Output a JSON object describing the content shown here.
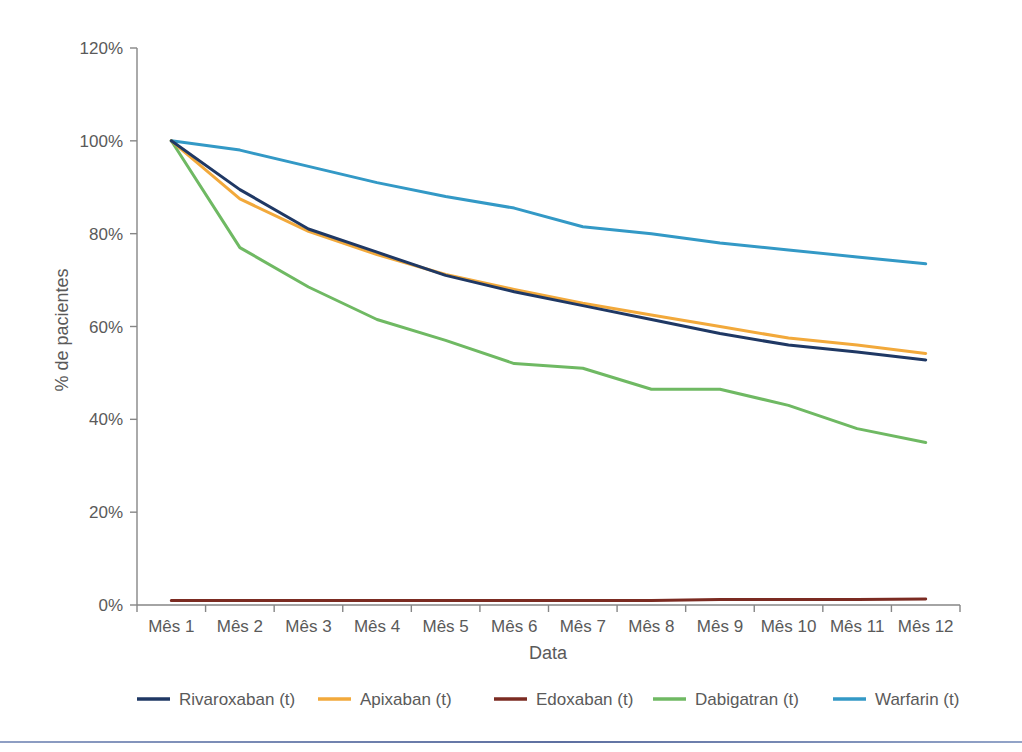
{
  "chart_data": {
    "type": "line",
    "title": "",
    "subtitle": "",
    "xlabel": "Data",
    "ylabel": "% de pacientes",
    "categories": [
      "Mês 1",
      "Mês 2",
      "Mês 3",
      "Mês 4",
      "Mês 5",
      "Mês 6",
      "Mês 7",
      "Mês 8",
      "Mês 9",
      "Mês 10",
      "Mês 11",
      "Mês 12"
    ],
    "ylim": [
      0,
      120
    ],
    "ytick_values": [
      0,
      20,
      40,
      60,
      80,
      100,
      120
    ],
    "ytick_labels": [
      "0%",
      "20%",
      "40%",
      "60%",
      "80%",
      "100%",
      "120%"
    ],
    "grid": false,
    "legend_position": "bottom",
    "value_suffix": "%",
    "series": [
      {
        "name": "Rivaroxaban (t)",
        "color": "#1F3864",
        "values": [
          100.0,
          89.5,
          81.0,
          76.0,
          71.0,
          67.5,
          64.5,
          61.5,
          58.5,
          56.0,
          54.5,
          52.8
        ]
      },
      {
        "name": "Apixaban (t)",
        "color": "#F2A93B",
        "values": [
          100.0,
          87.5,
          80.5,
          75.5,
          71.2,
          68.0,
          65.0,
          62.5,
          60.0,
          57.5,
          56.0,
          54.2
        ]
      },
      {
        "name": "Edoxaban (t)",
        "color": "#7B2B22",
        "values": [
          1.0,
          1.0,
          1.0,
          1.0,
          1.0,
          1.0,
          1.0,
          1.0,
          1.2,
          1.2,
          1.2,
          1.3
        ]
      },
      {
        "name": "Dabigatran (t)",
        "color": "#6FB963",
        "values": [
          100.0,
          77.0,
          68.5,
          61.5,
          57.0,
          52.0,
          51.0,
          46.5,
          46.5,
          43.0,
          38.0,
          35.0
        ]
      },
      {
        "name": "Warfarin (t)",
        "color": "#3399C6",
        "values": [
          100.0,
          98.0,
          94.5,
          91.0,
          88.0,
          85.5,
          81.5,
          80.0,
          78.0,
          76.5,
          75.0,
          73.5
        ]
      }
    ]
  },
  "axes": {
    "y_axis_title": "% de pacientes",
    "x_axis_title": "Data"
  },
  "legend": {
    "items": [
      {
        "label": "Rivaroxaban (t)",
        "color": "#1F3864"
      },
      {
        "label": "Apixaban (t)",
        "color": "#F2A93B"
      },
      {
        "label": "Edoxaban (t)",
        "color": "#7B2B22"
      },
      {
        "label": "Dabigatran (t)",
        "color": "#6FB963"
      },
      {
        "label": "Warfarin (t)",
        "color": "#3399C6"
      }
    ]
  },
  "colors": {
    "axis": "#868686",
    "text": "#5a5a5a",
    "background": "#ffffff",
    "footer_rule": "#5d6fa0"
  }
}
